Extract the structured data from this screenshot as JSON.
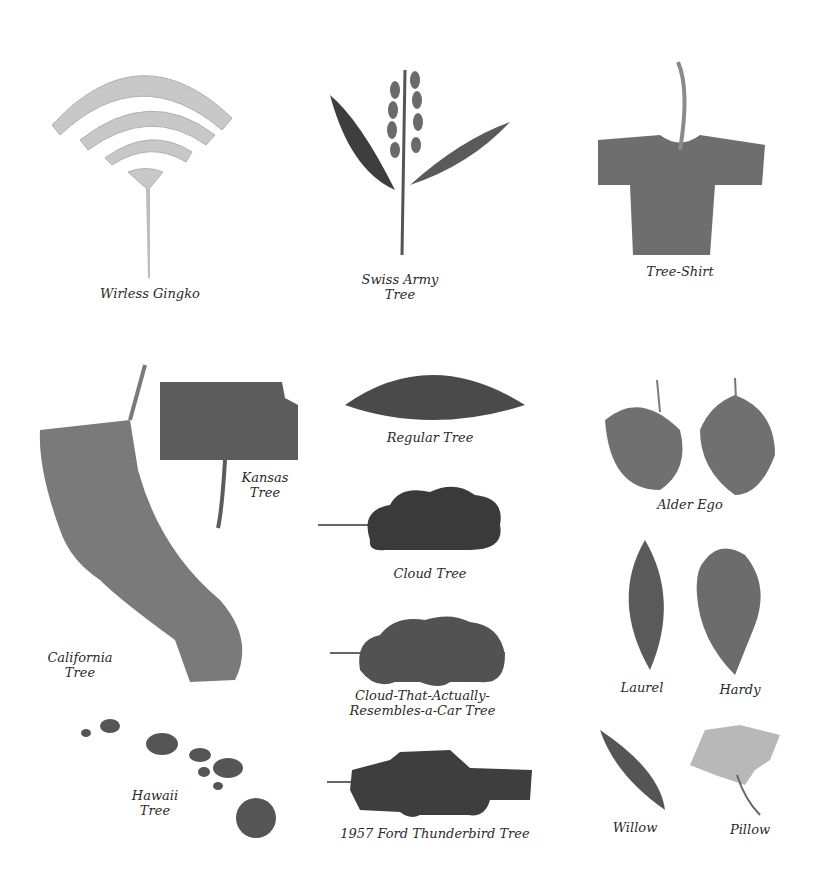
{
  "colors": {
    "background": "#ffffff",
    "ink": "#2a2a2a",
    "leaf_light": "#c8c8c8",
    "leaf_mid": "#7a7a7a",
    "leaf_dark": "#4a4a4a"
  },
  "specimens": [
    {
      "id": "wireless-gingko",
      "lines": [
        "Wirless Gingko"
      ]
    },
    {
      "id": "swiss-army-tree",
      "lines": [
        "Swiss Army",
        "Tree"
      ]
    },
    {
      "id": "tree-shirt",
      "lines": [
        "Tree-Shirt"
      ]
    },
    {
      "id": "california-tree",
      "lines": [
        "California",
        "Tree"
      ]
    },
    {
      "id": "kansas-tree",
      "lines": [
        "Kansas",
        "Tree"
      ]
    },
    {
      "id": "regular-tree",
      "lines": [
        "Regular Tree"
      ]
    },
    {
      "id": "cloud-tree",
      "lines": [
        "Cloud Tree"
      ]
    },
    {
      "id": "cloud-car-tree",
      "lines": [
        "Cloud-That-Actually-",
        "Resembles-a-Car Tree"
      ]
    },
    {
      "id": "hawaii-tree",
      "lines": [
        "Hawaii",
        "Tree"
      ]
    },
    {
      "id": "thunderbird-tree",
      "lines": [
        "1957 Ford Thunderbird Tree"
      ]
    },
    {
      "id": "alder-ego",
      "lines": [
        "Alder Ego"
      ]
    },
    {
      "id": "laurel",
      "lines": [
        "Laurel"
      ]
    },
    {
      "id": "hardy",
      "lines": [
        "Hardy"
      ]
    },
    {
      "id": "willow",
      "lines": [
        "Willow"
      ]
    },
    {
      "id": "pillow",
      "lines": [
        "Pillow"
      ]
    }
  ]
}
